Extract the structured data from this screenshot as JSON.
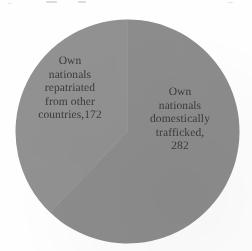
{
  "chart_data": {
    "type": "pie",
    "title": "",
    "xlabel": "",
    "ylabel": "",
    "total": 454,
    "legend_position": "none",
    "grid": false,
    "labels_inside": true,
    "categories": [
      "Own nationals domestically trafficked",
      "Own nationals repatriated from other countries"
    ],
    "values": [
      282,
      172
    ],
    "percentages": [
      62.1,
      37.9
    ],
    "colors": [
      "#8c8c8c",
      "#919191"
    ],
    "start_angle_deg": 0,
    "direction": "clockwise",
    "slices": [
      {
        "name": "own-nationals-domestically-trafficked",
        "value": 282,
        "percent": 62.1,
        "color": "#8c8c8c",
        "label_text": "Own\nnationals\ndomestically\ntrafficked,\n282"
      },
      {
        "name": "own-nationals-repatriated-from-other-countries",
        "value": 172,
        "percent": 37.9,
        "color": "#919191",
        "label_text": "Own\nnationals\nrepatriated\nfrom other\ncountries,172"
      }
    ]
  },
  "figure": {
    "labels": {
      "repatriated": "Own\nnationals\nrepatriated\nfrom other\ncountries,172",
      "domestic": "Own\nnationals\ndomestically\ntrafficked,\n282"
    }
  }
}
